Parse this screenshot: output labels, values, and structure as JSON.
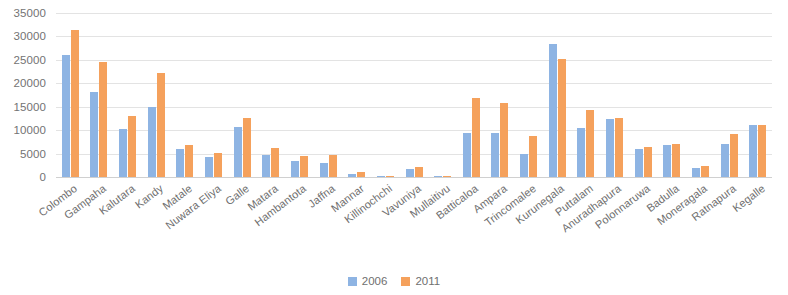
{
  "chart_data": {
    "type": "bar",
    "title": "",
    "subtitle": "",
    "xlabel": "",
    "ylabel": "",
    "ylim": [
      0,
      35000
    ],
    "yticks": [
      0,
      5000,
      10000,
      15000,
      20000,
      25000,
      30000,
      35000
    ],
    "ytick_labels": [
      "0",
      "5000",
      "10000",
      "15000",
      "20000",
      "25000",
      "30000",
      "35000"
    ],
    "grid": true,
    "legend_position": "bottom",
    "categories": [
      "Colombo",
      "Gampaha",
      "Kalutara",
      "Kandy",
      "Matale",
      "Nuwara Eliya",
      "Galle",
      "Matara",
      "Hambantota",
      "Jaffna",
      "Mannar",
      "Killinochchi",
      "Vavuniya",
      "Mullaitivu",
      "Batticaloa",
      "Ampara",
      "Trincomalee",
      "Kurunegala",
      "Puttalam",
      "Anuradhapura",
      "Polonnaruwa",
      "Badulla",
      "Moneragala",
      "Ratnapura",
      "Kegalle"
    ],
    "series": [
      {
        "name": "2006",
        "color": "#8eb4e3",
        "values": [
          26000,
          18200,
          10300,
          15000,
          6000,
          4200,
          10600,
          4800,
          3400,
          3000,
          700,
          200,
          1800,
          200,
          9400,
          9400,
          5000,
          28300,
          10400,
          12300,
          6000,
          6900,
          2000,
          7000,
          11000
        ]
      },
      {
        "name": "2011",
        "color": "#f5a15c",
        "values": [
          31400,
          24500,
          13000,
          22300,
          6800,
          5100,
          12600,
          6100,
          4400,
          4600,
          1000,
          300,
          2100,
          300,
          16800,
          15700,
          8700,
          25200,
          14400,
          12700,
          6400,
          7000,
          2300,
          9200,
          11200
        ]
      }
    ],
    "legend": [
      {
        "label": "2006",
        "color": "#8eb4e3"
      },
      {
        "label": "2011",
        "color": "#f5a15c"
      }
    ]
  }
}
